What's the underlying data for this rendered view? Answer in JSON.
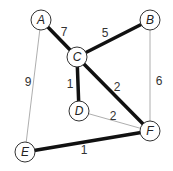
{
  "diagram": {
    "type": "weighted-undirected-graph",
    "highlighted_edges_meaning": "thick edges",
    "nodes": [
      {
        "id": "A",
        "label": "A",
        "x": 41,
        "y": 20
      },
      {
        "id": "B",
        "label": "B",
        "x": 150,
        "y": 20
      },
      {
        "id": "C",
        "label": "C",
        "x": 77,
        "y": 57
      },
      {
        "id": "D",
        "label": "D",
        "x": 79,
        "y": 111
      },
      {
        "id": "E",
        "label": "E",
        "x": 25,
        "y": 152
      },
      {
        "id": "F",
        "label": "F",
        "x": 150,
        "y": 131
      }
    ],
    "edges": [
      {
        "from": "A",
        "to": "C",
        "weight": "7",
        "thick": true,
        "label_x": 64,
        "label_y": 32
      },
      {
        "from": "C",
        "to": "B",
        "weight": "5",
        "thick": true,
        "label_x": 105,
        "label_y": 33
      },
      {
        "from": "C",
        "to": "D",
        "weight": "1",
        "thick": true,
        "label_x": 70,
        "label_y": 84
      },
      {
        "from": "C",
        "to": "F",
        "weight": "2",
        "thick": true,
        "label_x": 117,
        "label_y": 87
      },
      {
        "from": "D",
        "to": "F",
        "weight": "2",
        "thick": false,
        "label_x": 113,
        "label_y": 116
      },
      {
        "from": "B",
        "to": "F",
        "weight": "6",
        "thick": false,
        "label_x": 159,
        "label_y": 81
      },
      {
        "from": "A",
        "to": "E",
        "weight": "9",
        "thick": false,
        "label_x": 28,
        "label_y": 82
      },
      {
        "from": "E",
        "to": "F",
        "weight": "1",
        "thick": true,
        "label_x": 84,
        "label_y": 150
      }
    ]
  }
}
